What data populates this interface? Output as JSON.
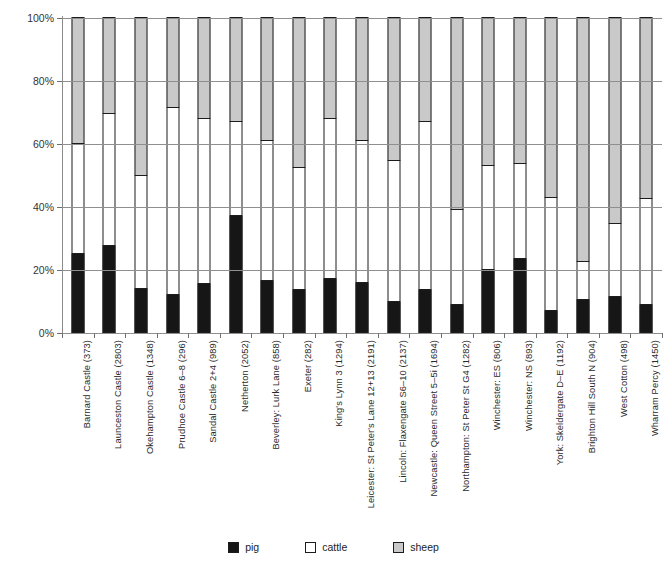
{
  "chart_data": {
    "type": "bar",
    "subtype": "stacked-percentage-column",
    "title": "",
    "xlabel": "",
    "ylabel": "",
    "ylim": [
      0,
      100
    ],
    "ytick_labels": [
      "0%",
      "20%",
      "40%",
      "60%",
      "80%",
      "100%"
    ],
    "ytick_values": [
      0,
      20,
      40,
      60,
      80,
      100
    ],
    "grid": true,
    "legend_position": "bottom",
    "categories": [
      "Barnard Castle (373)",
      "Launceston Castle (2803)",
      "Okehampton Castle (1348)",
      "Prudhoe Castle 6–8 (296)",
      "Sandal Castle 2+4 (989)",
      "Netherton (2052)",
      "Beverley: Lurk Lane (858)",
      "Exeter (282)",
      "King's Lynn 3 (1294)",
      "Leicester: St Peter's Lane 12+13 (2191)",
      "Lincoln: Flaxengate S6–10 (2137)",
      "Newcastle: Queen Street 5–5i (1694)",
      "Northampton: St Peter St G4 (1282)",
      "Winchester: ES (806)",
      "Winchester: NS (893)",
      "York: Skeldergate D–E (1192)",
      "Brighton Hill South N (904)",
      "West Cotton (498)",
      "Wharram Percy (1450)"
    ],
    "series": [
      {
        "name": "pig",
        "color": "#161616",
        "values": [
          25.0,
          27.5,
          14.0,
          12.0,
          15.5,
          37.0,
          16.5,
          13.5,
          17.0,
          16.0,
          10.0,
          13.5,
          9.0,
          20.0,
          23.5,
          7.0,
          10.5,
          11.5,
          9.0
        ]
      },
      {
        "name": "cattle",
        "color": "#ffffff",
        "values": [
          35.0,
          42.0,
          36.0,
          59.5,
          52.5,
          30.0,
          44.5,
          39.0,
          51.0,
          45.0,
          44.5,
          53.5,
          30.0,
          33.0,
          30.0,
          36.0,
          12.0,
          23.0,
          33.5
        ]
      },
      {
        "name": "sheep",
        "color": "#c9c9c9",
        "values": [
          40.0,
          30.5,
          50.0,
          28.5,
          32.0,
          33.0,
          39.0,
          47.5,
          32.0,
          39.0,
          45.5,
          33.0,
          61.0,
          47.0,
          46.5,
          57.0,
          77.5,
          65.5,
          57.5
        ]
      }
    ]
  },
  "legend": {
    "items": [
      {
        "label": "pig",
        "color": "#161616"
      },
      {
        "label": "cattle",
        "color": "#ffffff"
      },
      {
        "label": "sheep",
        "color": "#c9c9c9"
      }
    ]
  }
}
